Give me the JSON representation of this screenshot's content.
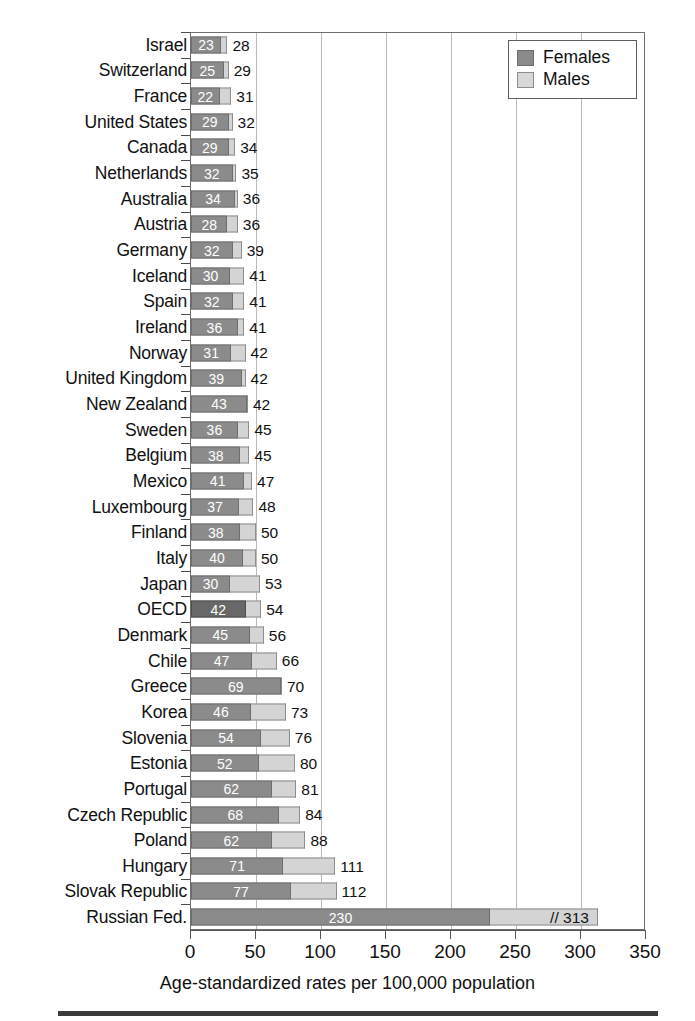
{
  "chart_data": {
    "type": "bar",
    "orientation": "horizontal",
    "stacked": true,
    "title": "",
    "subtitle": "",
    "xlabel": "Age-standardized rates per 100,000 population",
    "ylabel": "",
    "xlim": [
      0,
      350
    ],
    "xticks": [
      0,
      50,
      100,
      150,
      200,
      250,
      300,
      350
    ],
    "xticklabels": [
      "0",
      "50",
      "100",
      "150",
      "200",
      "250",
      "300",
      "350"
    ],
    "grid": "vertical",
    "legend_position": "top-right",
    "legend": [
      "Females",
      "Males"
    ],
    "colors": {
      "females": "#8b8b8b",
      "males": "#d4d4d4",
      "females_highlight": "#686868",
      "gridline": "#b9b9b9",
      "axis": "#555555",
      "frame": "#6f6f6f"
    },
    "series": [
      {
        "name": "Females",
        "values": [
          23,
          25,
          22,
          29,
          29,
          32,
          34,
          28,
          32,
          30,
          32,
          36,
          31,
          39,
          43,
          36,
          38,
          41,
          37,
          38,
          40,
          30,
          42,
          45,
          47,
          69,
          46,
          54,
          52,
          62,
          68,
          62,
          71,
          77,
          230
        ]
      },
      {
        "name": "Males",
        "values": [
          28,
          29,
          31,
          32,
          34,
          35,
          36,
          36,
          39,
          41,
          41,
          41,
          42,
          42,
          42,
          45,
          45,
          47,
          48,
          50,
          50,
          53,
          54,
          56,
          66,
          70,
          73,
          76,
          80,
          81,
          84,
          88,
          111,
          112,
          313
        ]
      }
    ],
    "categories": [
      "Israel",
      "Switzerland",
      "France",
      "United States",
      "Canada",
      "Netherlands",
      "Australia",
      "Austria",
      "Germany",
      "Iceland",
      "Spain",
      "Ireland",
      "Norway",
      "United Kingdom",
      "New Zealand",
      "Sweden",
      "Belgium",
      "Mexico",
      "Luxembourg",
      "Finland",
      "Italy",
      "Japan",
      "OECD",
      "Denmark",
      "Chile",
      "Greece",
      "Korea",
      "Slovenia",
      "Estonia",
      "Portugal",
      "Czech Republic",
      "Poland",
      "Hungary",
      "Slovak Republic",
      "Russian Fed."
    ],
    "rows": [
      {
        "label": "Israel",
        "females": 23,
        "males": 28,
        "males_text": "28",
        "highlight": false,
        "axis_break": false
      },
      {
        "label": "Switzerland",
        "females": 25,
        "males": 29,
        "males_text": "29",
        "highlight": false,
        "axis_break": false
      },
      {
        "label": "France",
        "females": 22,
        "males": 31,
        "males_text": "31",
        "highlight": false,
        "axis_break": false
      },
      {
        "label": "United States",
        "females": 29,
        "males": 32,
        "males_text": "32",
        "highlight": false,
        "axis_break": false
      },
      {
        "label": "Canada",
        "females": 29,
        "males": 34,
        "males_text": "34",
        "highlight": false,
        "axis_break": false
      },
      {
        "label": "Netherlands",
        "females": 32,
        "males": 35,
        "males_text": "35",
        "highlight": false,
        "axis_break": false
      },
      {
        "label": "Australia",
        "females": 34,
        "males": 36,
        "males_text": "36",
        "highlight": false,
        "axis_break": false
      },
      {
        "label": "Austria",
        "females": 28,
        "males": 36,
        "males_text": "36",
        "highlight": false,
        "axis_break": false
      },
      {
        "label": "Germany",
        "females": 32,
        "males": 39,
        "males_text": "39",
        "highlight": false,
        "axis_break": false
      },
      {
        "label": "Iceland",
        "females": 30,
        "males": 41,
        "males_text": "41",
        "highlight": false,
        "axis_break": false
      },
      {
        "label": "Spain",
        "females": 32,
        "males": 41,
        "males_text": "41",
        "highlight": false,
        "axis_break": false
      },
      {
        "label": "Ireland",
        "females": 36,
        "males": 41,
        "males_text": "41",
        "highlight": false,
        "axis_break": false
      },
      {
        "label": "Norway",
        "females": 31,
        "males": 42,
        "males_text": "42",
        "highlight": false,
        "axis_break": false
      },
      {
        "label": "United Kingdom",
        "females": 39,
        "males": 42,
        "males_text": "42",
        "highlight": false,
        "axis_break": false
      },
      {
        "label": "New Zealand",
        "females": 43,
        "males": 42,
        "males_text": "42",
        "highlight": false,
        "axis_break": false
      },
      {
        "label": "Sweden",
        "females": 36,
        "males": 45,
        "males_text": "45",
        "highlight": false,
        "axis_break": false
      },
      {
        "label": "Belgium",
        "females": 38,
        "males": 45,
        "males_text": "45",
        "highlight": false,
        "axis_break": false
      },
      {
        "label": "Mexico",
        "females": 41,
        "males": 47,
        "males_text": "47",
        "highlight": false,
        "axis_break": false
      },
      {
        "label": "Luxembourg",
        "females": 37,
        "males": 48,
        "males_text": "48",
        "highlight": false,
        "axis_break": false
      },
      {
        "label": "Finland",
        "females": 38,
        "males": 50,
        "males_text": "50",
        "highlight": false,
        "axis_break": false
      },
      {
        "label": "Italy",
        "females": 40,
        "males": 50,
        "males_text": "50",
        "highlight": false,
        "axis_break": false
      },
      {
        "label": "Japan",
        "females": 30,
        "males": 53,
        "males_text": "53",
        "highlight": false,
        "axis_break": false
      },
      {
        "label": "OECD",
        "females": 42,
        "males": 54,
        "males_text": "54",
        "highlight": true,
        "axis_break": false
      },
      {
        "label": "Denmark",
        "females": 45,
        "males": 56,
        "males_text": "56",
        "highlight": false,
        "axis_break": false
      },
      {
        "label": "Chile",
        "females": 47,
        "males": 66,
        "males_text": "66",
        "highlight": false,
        "axis_break": false
      },
      {
        "label": "Greece",
        "females": 69,
        "males": 70,
        "males_text": "70",
        "highlight": false,
        "axis_break": false
      },
      {
        "label": "Korea",
        "females": 46,
        "males": 73,
        "males_text": "73",
        "highlight": false,
        "axis_break": false
      },
      {
        "label": "Slovenia",
        "females": 54,
        "males": 76,
        "males_text": "76",
        "highlight": false,
        "axis_break": false
      },
      {
        "label": "Estonia",
        "females": 52,
        "males": 80,
        "males_text": "80",
        "highlight": false,
        "axis_break": false
      },
      {
        "label": "Portugal",
        "females": 62,
        "males": 81,
        "males_text": "81",
        "highlight": false,
        "axis_break": false
      },
      {
        "label": "Czech Republic",
        "females": 68,
        "males": 84,
        "males_text": "84",
        "highlight": false,
        "axis_break": false
      },
      {
        "label": "Poland",
        "females": 62,
        "males": 88,
        "males_text": "88",
        "highlight": false,
        "axis_break": false
      },
      {
        "label": "Hungary",
        "females": 71,
        "males": 111,
        "males_text": "111",
        "highlight": false,
        "axis_break": false
      },
      {
        "label": "Slovak Republic",
        "females": 77,
        "males": 112,
        "males_text": "112",
        "highlight": false,
        "axis_break": false
      },
      {
        "label": "Russian Fed.",
        "females": 230,
        "males": 313,
        "males_text": "// 313",
        "highlight": false,
        "axis_break": true
      }
    ]
  }
}
